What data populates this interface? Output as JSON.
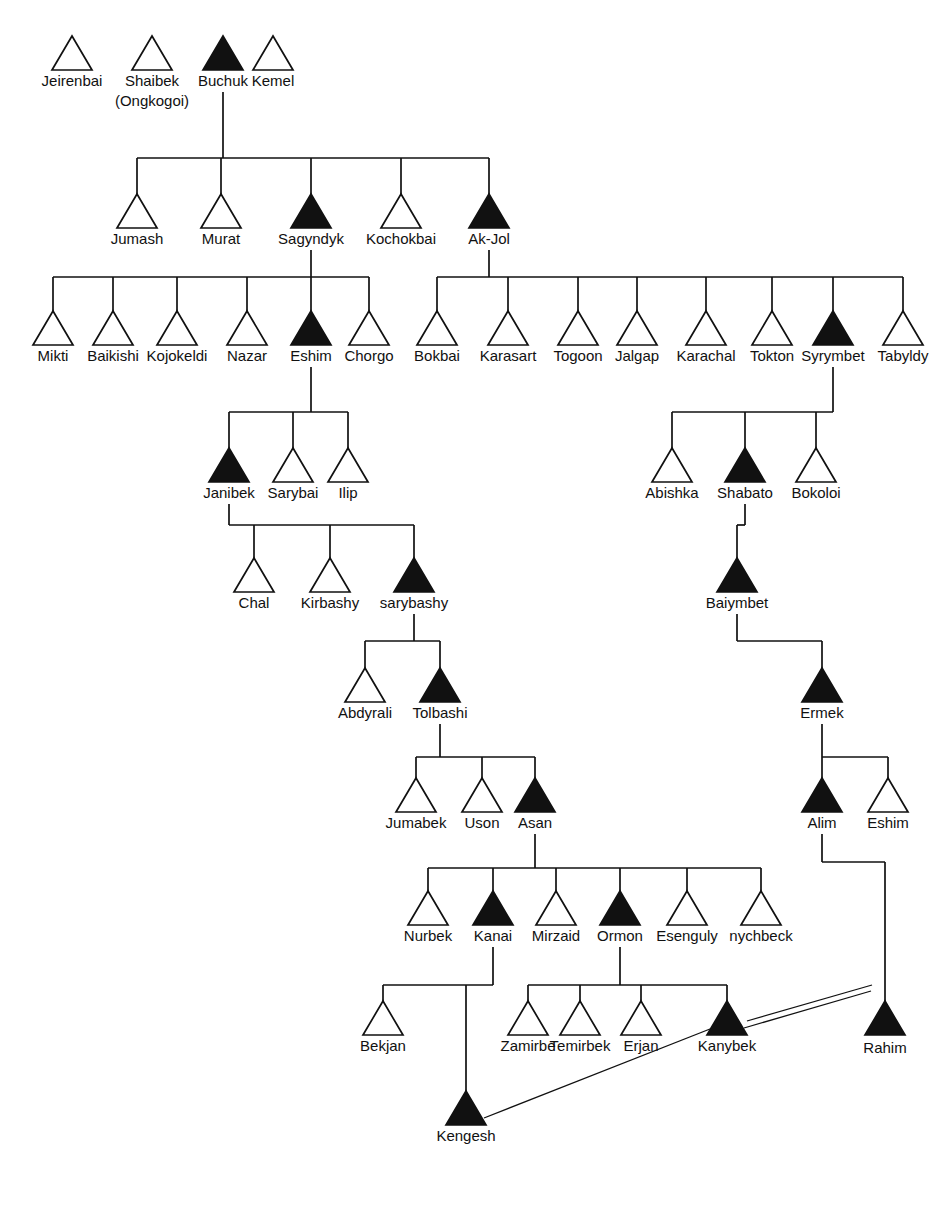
{
  "diagram": {
    "type": "kinship-genealogy-chart",
    "title": "",
    "symbols": {
      "open_triangle": "male (unmarked lineage)",
      "filled_triangle": "male (highlighted / focal lineage)"
    },
    "tri_size": {
      "half_width": 20,
      "height": 34
    },
    "label_offset": 16,
    "generations": [
      {
        "id": "gen1",
        "y": 70,
        "persons": [
          {
            "id": "jeirenbai",
            "label": "Jeirenbai",
            "x": 72,
            "filled": false
          },
          {
            "id": "shaibek",
            "label": "Shaibek",
            "sublabel": "(Ongkogoi)",
            "x": 152,
            "filled": false
          },
          {
            "id": "buchuk",
            "label": "Buchuk",
            "x": 223,
            "filled": true
          },
          {
            "id": "kemel",
            "label": "Kemel",
            "x": 273,
            "filled": false
          }
        ]
      },
      {
        "id": "gen2",
        "y": 228,
        "persons": [
          {
            "id": "jumash",
            "label": "Jumash",
            "x": 137,
            "filled": false
          },
          {
            "id": "murat",
            "label": "Murat",
            "x": 221,
            "filled": false
          },
          {
            "id": "sagyndyk",
            "label": "Sagyndyk",
            "x": 311,
            "filled": true
          },
          {
            "id": "kochokbai",
            "label": "Kochokbai",
            "x": 401,
            "filled": false
          },
          {
            "id": "ak-jol",
            "label": "Ak-Jol",
            "x": 489,
            "filled": true
          }
        ]
      },
      {
        "id": "gen3",
        "y": 345,
        "persons": [
          {
            "id": "mikti",
            "label": "Mikti",
            "x": 53,
            "filled": false
          },
          {
            "id": "baikishi",
            "label": "Baikishi",
            "x": 113,
            "filled": false
          },
          {
            "id": "kojokeldi",
            "label": "Kojokeldi",
            "x": 177,
            "filled": false
          },
          {
            "id": "nazar",
            "label": "Nazar",
            "x": 247,
            "filled": false
          },
          {
            "id": "eshim1",
            "label": "Eshim",
            "x": 311,
            "filled": true
          },
          {
            "id": "chorgo",
            "label": "Chorgo",
            "x": 369,
            "filled": false
          },
          {
            "id": "bokbai",
            "label": "Bokbai",
            "x": 437,
            "filled": false
          },
          {
            "id": "karasart",
            "label": "Karasart",
            "x": 508,
            "filled": false
          },
          {
            "id": "togoon",
            "label": "Togoon",
            "x": 578,
            "filled": false
          },
          {
            "id": "jalgap",
            "label": "Jalgap",
            "x": 637,
            "filled": false
          },
          {
            "id": "karachal",
            "label": "Karachal",
            "x": 706,
            "filled": false
          },
          {
            "id": "tokton",
            "label": "Tokton",
            "x": 772,
            "filled": false
          },
          {
            "id": "syrymbet",
            "label": "Syrymbet",
            "x": 833,
            "filled": true
          },
          {
            "id": "tabyldy",
            "label": "Tabyldy",
            "x": 903,
            "filled": false
          }
        ]
      },
      {
        "id": "gen4",
        "y": 482,
        "persons": [
          {
            "id": "janibek",
            "label": "Janibek",
            "x": 229,
            "filled": true
          },
          {
            "id": "sarybai",
            "label": "Sarybai",
            "x": 293,
            "filled": false
          },
          {
            "id": "ilip",
            "label": "Ilip",
            "x": 348,
            "filled": false
          },
          {
            "id": "abishka",
            "label": "Abishka",
            "x": 672,
            "filled": false
          },
          {
            "id": "shabato",
            "label": "Shabato",
            "x": 745,
            "filled": true
          },
          {
            "id": "bokoloi",
            "label": "Bokoloi",
            "x": 816,
            "filled": false
          }
        ]
      },
      {
        "id": "gen5",
        "y": 592,
        "persons": [
          {
            "id": "chal",
            "label": "Chal",
            "x": 254,
            "filled": false
          },
          {
            "id": "kirbashy",
            "label": "Kirbashy",
            "x": 330,
            "filled": false
          },
          {
            "id": "sarybashy",
            "label": "sarybashy",
            "x": 414,
            "filled": true
          },
          {
            "id": "baiymbet",
            "label": "Baiymbet",
            "x": 737,
            "filled": true
          }
        ]
      },
      {
        "id": "gen6",
        "y": 702,
        "persons": [
          {
            "id": "abdyrali",
            "label": "Abdyrali",
            "x": 365,
            "filled": false
          },
          {
            "id": "tolbashi",
            "label": "Tolbashi",
            "x": 440,
            "filled": true
          },
          {
            "id": "ermek",
            "label": "Ermek",
            "x": 822,
            "filled": true
          }
        ]
      },
      {
        "id": "gen7",
        "y": 812,
        "persons": [
          {
            "id": "jumabek",
            "label": "Jumabek",
            "x": 416,
            "filled": false
          },
          {
            "id": "uson",
            "label": "Uson",
            "x": 482,
            "filled": false
          },
          {
            "id": "asan",
            "label": "Asan",
            "x": 535,
            "filled": true
          },
          {
            "id": "alim",
            "label": "Alim",
            "x": 822,
            "filled": true
          },
          {
            "id": "eshim2",
            "label": "Eshim",
            "x": 888,
            "filled": false
          }
        ]
      },
      {
        "id": "gen8",
        "y": 925,
        "persons": [
          {
            "id": "nurbek",
            "label": "Nurbek",
            "x": 428,
            "filled": false
          },
          {
            "id": "kanai",
            "label": "Kanai",
            "x": 493,
            "filled": true
          },
          {
            "id": "mirzaid",
            "label": "Mirzaid",
            "x": 556,
            "filled": false
          },
          {
            "id": "ormon",
            "label": "Ormon",
            "x": 620,
            "filled": true
          },
          {
            "id": "esenguly",
            "label": "Esenguly",
            "x": 687,
            "filled": false
          },
          {
            "id": "nychbeck",
            "label": "nychbeck",
            "x": 761,
            "filled": false
          }
        ]
      },
      {
        "id": "gen9",
        "y": 1035,
        "persons": [
          {
            "id": "bekjan",
            "label": "Bekjan",
            "x": 383,
            "filled": false
          },
          {
            "id": "zamirbe",
            "label": "Zamirbe",
            "x": 528,
            "filled": false
          },
          {
            "id": "temirbek",
            "label": "Temirbek",
            "x": 580,
            "filled": false
          },
          {
            "id": "erjan",
            "label": "Erjan",
            "x": 641,
            "filled": false
          },
          {
            "id": "kanybek",
            "label": "Kanybek",
            "x": 727,
            "filled": true
          },
          {
            "id": "rahim",
            "label": "Rahim",
            "x": 885,
            "filled": true,
            "label_dy": 2
          }
        ]
      },
      {
        "id": "gen10",
        "y": 1125,
        "persons": [
          {
            "id": "kengesh",
            "label": "Kengesh",
            "x": 466,
            "filled": true
          }
        ]
      }
    ],
    "families": [
      {
        "id": "f-buchuk",
        "parent": "buchuk",
        "parent_x": 223,
        "stem_top": 92,
        "bus_y": 158,
        "children_x": [
          137,
          221,
          311,
          401,
          489
        ],
        "child_top": 194
      },
      {
        "id": "f-sagyndyk",
        "parent": "sagyndyk",
        "parent_x": 311,
        "stem_top": 250,
        "bus_y": 277,
        "children_x": [
          53,
          113,
          177,
          247,
          311,
          369
        ],
        "child_top": 311
      },
      {
        "id": "f-ak-jol",
        "parent": "ak-jol",
        "parent_x": 489,
        "stem_top": 250,
        "bus_y": 277,
        "children_x": [
          437,
          508,
          578,
          637,
          706,
          772,
          833,
          903
        ],
        "child_top": 311
      },
      {
        "id": "f-eshim1",
        "parent": "eshim1",
        "parent_x": 311,
        "stem_top": 367,
        "bus_y": 412,
        "children_x": [
          229,
          293,
          348
        ],
        "child_top": 448
      },
      {
        "id": "f-syrymbet",
        "parent": "syrymbet",
        "parent_x": 833,
        "stem_top": 367,
        "bus_y": 412,
        "children_x": [
          672,
          745,
          816
        ],
        "child_top": 448
      },
      {
        "id": "f-janibek",
        "parent": "janibek",
        "parent_x": 229,
        "stem_top": 504,
        "bus_y": 525,
        "children_x": [
          254,
          330,
          414
        ],
        "child_top": 558
      },
      {
        "id": "f-shabato",
        "parent": "shabato",
        "parent_x": 745,
        "stem_top": 504,
        "bus_y": 525,
        "children_x": [
          737
        ],
        "child_top": 558
      },
      {
        "id": "f-sarybashy",
        "parent": "sarybashy",
        "parent_x": 414,
        "stem_top": 614,
        "bus_y": 641,
        "children_x": [
          365,
          440
        ],
        "child_top": 668
      },
      {
        "id": "f-baiymbet",
        "parent": "baiymbet",
        "parent_x": 737,
        "stem_top": 614,
        "bus_y": 641,
        "children_x": [
          822
        ],
        "child_top": 668
      },
      {
        "id": "f-tolbashi",
        "parent": "tolbashi",
        "parent_x": 440,
        "stem_top": 724,
        "bus_y": 757,
        "children_x": [
          416,
          482,
          535
        ],
        "child_top": 778
      },
      {
        "id": "f-ermek",
        "parent": "ermek",
        "parent_x": 822,
        "stem_top": 724,
        "bus_y": 757,
        "children_x": [
          822,
          888
        ],
        "child_top": 778
      },
      {
        "id": "f-asan",
        "parent": "asan",
        "parent_x": 535,
        "stem_top": 834,
        "bus_y": 868,
        "children_x": [
          428,
          493,
          556,
          620,
          687,
          761
        ],
        "child_top": 891
      },
      {
        "id": "f-kanai",
        "parent": "kanai",
        "parent_x": 493,
        "stem_top": 947,
        "bus_y": 985,
        "children_x": [
          383,
          466
        ],
        "child_top": 1001
      },
      {
        "id": "f-ormon",
        "parent": "ormon",
        "parent_x": 620,
        "stem_top": 947,
        "bus_y": 985,
        "children_x": [
          528,
          580,
          641,
          727
        ],
        "child_top": 1001
      },
      {
        "id": "f-alim",
        "parent": "alim",
        "parent_x": 822,
        "stem_top": 834,
        "bus_y": 862,
        "children_x": [
          885
        ],
        "child_top": 1001
      }
    ],
    "direct_stems": [
      {
        "id": "stem-bekjan-to-kengesh",
        "x": 466,
        "y1": 1001,
        "y2": 1103
      }
    ],
    "relation_links": [
      {
        "id": "kanybek-rahim-a",
        "x1": 747,
        "y1": 1021,
        "x2": 872,
        "y2": 985,
        "style": "double"
      },
      {
        "id": "kanybek-rahim-b",
        "x1": 744,
        "y1": 1028,
        "x2": 871,
        "y2": 991,
        "style": "double"
      },
      {
        "id": "erjan-kengesh",
        "x1": 484,
        "y1": 1118,
        "x2": 710,
        "y2": 1029,
        "style": "single"
      }
    ]
  }
}
